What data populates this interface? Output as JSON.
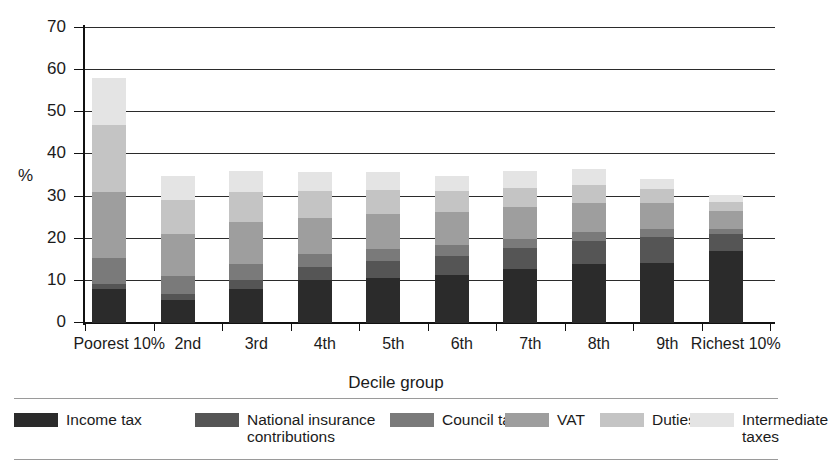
{
  "chart_data": {
    "type": "bar",
    "subtype": "stacked-vertical",
    "title": "",
    "xlabel": "Decile group",
    "ylabel": "%",
    "ylim": [
      0,
      70
    ],
    "ytick_values": [
      0,
      10,
      20,
      30,
      40,
      50,
      60,
      70
    ],
    "ytick_labels": [
      "0",
      "10",
      "20",
      "30",
      "40",
      "50",
      "60",
      "70"
    ],
    "grid": "horizontal",
    "legend_position": "bottom",
    "categories": [
      "Poorest\n10%",
      "2nd",
      "3rd",
      "4th",
      "5th",
      "6th",
      "7th",
      "8th",
      "9th",
      "Richest\n10%"
    ],
    "series": [
      {
        "name": "Income tax",
        "color": "#2b2b2b",
        "values": [
          8.1,
          5.4,
          8.0,
          10.1,
          10.6,
          11.4,
          12.7,
          13.9,
          14.3,
          17.0
        ]
      },
      {
        "name": "National insurance\ncontributions",
        "color": "#555555",
        "values": [
          1.2,
          1.4,
          2.3,
          3.2,
          4.2,
          4.6,
          5.0,
          5.5,
          6.2,
          4.2
        ]
      },
      {
        "name": "Council tax",
        "color": "#7a7a7a",
        "values": [
          6.2,
          4.4,
          3.7,
          3.0,
          2.7,
          2.6,
          2.3,
          2.1,
          1.9,
          1.2
        ]
      },
      {
        "name": "VAT",
        "color": "#9e9e9e",
        "values": [
          15.5,
          9.9,
          9.9,
          8.7,
          8.3,
          7.8,
          7.5,
          7.0,
          6.0,
          4.1
        ]
      },
      {
        "name": "Duties",
        "color": "#c4c4c4",
        "values": [
          16.0,
          8.2,
          7.3,
          6.3,
          5.8,
          4.9,
          4.6,
          4.3,
          3.3,
          2.3
        ]
      },
      {
        "name": "Intermediate\ntaxes",
        "color": "#e4e4e4",
        "values": [
          11.2,
          5.6,
          4.9,
          4.5,
          4.2,
          3.7,
          3.9,
          3.8,
          2.5,
          1.7
        ]
      }
    ],
    "totals": [
      58.2,
      34.9,
      36.1,
      35.8,
      35.8,
      35.0,
      36.0,
      36.6,
      34.2,
      30.5
    ]
  },
  "axis": {
    "y_title": "%",
    "x_title": "Decile group"
  },
  "legend": {
    "entries": [
      {
        "label": "Income tax",
        "color": "#2b2b2b"
      },
      {
        "label": "National insurance\ncontributions",
        "color": "#555555"
      },
      {
        "label": "Council tax",
        "color": "#7a7a7a"
      },
      {
        "label": "VAT",
        "color": "#9e9e9e"
      },
      {
        "label": "Duties",
        "color": "#c4c4c4"
      },
      {
        "label": "Intermediate\ntaxes",
        "color": "#e4e4e4"
      }
    ]
  }
}
